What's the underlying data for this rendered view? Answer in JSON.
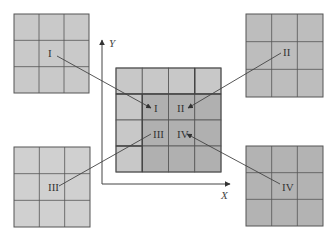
{
  "diagram": {
    "axes": {
      "x_label": "X",
      "y_label": "Y"
    },
    "center_grid": {
      "rows": 4,
      "cols": 4,
      "quadrant_labels": [
        "I",
        "II",
        "III",
        "IV"
      ]
    },
    "source_grids": [
      {
        "id": "I",
        "label": "I",
        "position": "top-left",
        "rows": 3,
        "cols": 3,
        "color": "#c9c9c9"
      },
      {
        "id": "II",
        "label": "II",
        "position": "top-right",
        "rows": 3,
        "cols": 3,
        "color": "#bdbdbd"
      },
      {
        "id": "III",
        "label": "III",
        "position": "bottom-left",
        "rows": 3,
        "cols": 3,
        "color": "#d0d0d0"
      },
      {
        "id": "IV",
        "label": "IV",
        "position": "bottom-right",
        "rows": 3,
        "cols": 3,
        "color": "#b3b3b3"
      }
    ],
    "colors": {
      "grid_line": "#555555",
      "arrow": "#444444",
      "center_light": "#c8c8c8",
      "center_dark": "#b0b0b0"
    }
  }
}
